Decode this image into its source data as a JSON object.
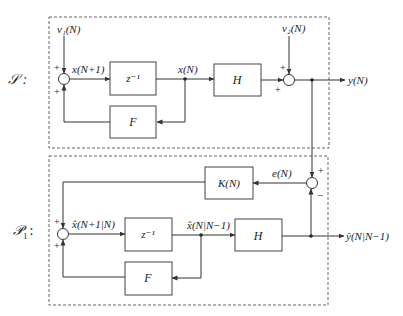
{
  "system_label": "𝒮 :",
  "predictor_label": "𝒫",
  "predictor_label_sub": "1",
  "predictor_label_colon": ":",
  "system": {
    "input1": "v₁(N)",
    "input2": "v₂(N)",
    "state_next": "x(N+1)",
    "delay_block": "z⁻¹",
    "state": "x(N)",
    "output_block": "H",
    "feedback_block": "F",
    "output": "y(N)",
    "sum1_signs": [
      "+",
      "+"
    ],
    "sum2_signs": [
      "+",
      "+"
    ]
  },
  "predictor": {
    "gain_block": "K(N)",
    "error": "e(N)",
    "state_next": "x̂(N+1|N)",
    "delay_block": "z⁻¹",
    "state": "x̂(N|N−1)",
    "output_block": "H",
    "feedback_block": "F",
    "output": "ŷ(N|N−1)",
    "sum1_signs": [
      "+",
      "+"
    ],
    "error_sum_signs": [
      "+",
      "−"
    ]
  }
}
